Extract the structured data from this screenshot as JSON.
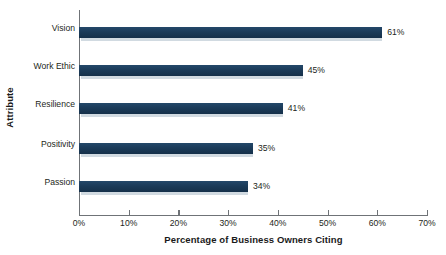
{
  "chart_data": {
    "type": "bar",
    "orientation": "horizontal",
    "title": "",
    "xlabel": "Percentage of Business Owners Citing",
    "ylabel": "Attribute",
    "categories": [
      "Vision",
      "Work Ethic",
      "Resilience",
      "Positivity",
      "Passion"
    ],
    "values": [
      61,
      45,
      41,
      35,
      34
    ],
    "value_labels": [
      "61%",
      "45%",
      "41%",
      "35%",
      "34%"
    ],
    "xlim": [
      0,
      70
    ],
    "xticks": [
      0,
      10,
      20,
      30,
      40,
      50,
      60,
      70
    ],
    "xtick_labels": [
      "0%",
      "10%",
      "20%",
      "30%",
      "40%",
      "50%",
      "60%",
      "70%"
    ],
    "grid": false,
    "legend": null,
    "bar_color": "#1d3f5e",
    "axis_color": "#6f7377",
    "text_color": "#231f20"
  }
}
